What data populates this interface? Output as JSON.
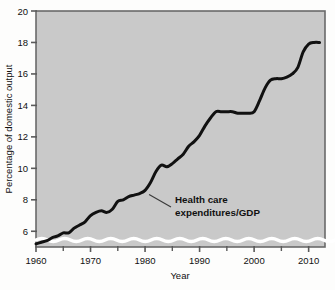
{
  "chart_data": {
    "type": "line",
    "title": "",
    "xlabel": "Year",
    "ylabel": "Percentage of domestic output",
    "xlim": [
      1960,
      2013
    ],
    "ylim": [
      5,
      20
    ],
    "y_axis_broken": true,
    "grid": false,
    "legend_position": "none",
    "x_major_ticks": [
      1960,
      1970,
      1980,
      1990,
      2000,
      2010
    ],
    "x_minor_ticks": [
      1965,
      1975,
      1985,
      1995,
      2005
    ],
    "x_tick_labels": [
      "1960",
      "1970",
      "1980",
      "1990",
      "2000",
      "2010"
    ],
    "y_ticks": [
      6,
      8,
      10,
      12,
      14,
      16,
      18,
      20
    ],
    "y_tick_labels": [
      "6",
      "8",
      "10",
      "12",
      "14",
      "16",
      "18",
      "20"
    ],
    "series": [
      {
        "name": "Health care expenditures/GDP",
        "color": "#111111",
        "x": [
          1960,
          1961,
          1962,
          1963,
          1964,
          1965,
          1966,
          1967,
          1968,
          1969,
          1970,
          1971,
          1972,
          1973,
          1974,
          1975,
          1976,
          1977,
          1978,
          1979,
          1980,
          1981,
          1982,
          1983,
          1984,
          1985,
          1986,
          1987,
          1988,
          1989,
          1990,
          1991,
          1992,
          1993,
          1994,
          1995,
          1996,
          1997,
          1998,
          1999,
          2000,
          2001,
          2002,
          2003,
          2004,
          2005,
          2006,
          2007,
          2008,
          2009,
          2010,
          2011,
          2012
        ],
        "values": [
          5.2,
          5.3,
          5.4,
          5.6,
          5.7,
          5.9,
          5.9,
          6.2,
          6.4,
          6.6,
          7.0,
          7.2,
          7.3,
          7.2,
          7.4,
          7.9,
          8.0,
          8.2,
          8.3,
          8.4,
          8.6,
          9.1,
          9.8,
          10.2,
          10.1,
          10.3,
          10.6,
          10.9,
          11.4,
          11.7,
          12.1,
          12.7,
          13.2,
          13.6,
          13.6,
          13.6,
          13.6,
          13.5,
          13.5,
          13.5,
          13.6,
          14.3,
          15.1,
          15.6,
          15.7,
          15.7,
          15.8,
          16.0,
          16.4,
          17.4,
          17.9,
          18.0,
          18.0
        ]
      }
    ],
    "annotations": [
      {
        "name": "series-callout",
        "line1": "Health care",
        "line2": "expenditures/GDP",
        "points_to_year": 1980,
        "points_to_value": 8.6
      }
    ],
    "colors": {
      "plot_background": "#c9c9c9",
      "page_background": "#fdfdfc",
      "line": "#111111",
      "axis": "#5a5a5a",
      "text": "#111111",
      "break_wave": "#ffffff"
    }
  }
}
